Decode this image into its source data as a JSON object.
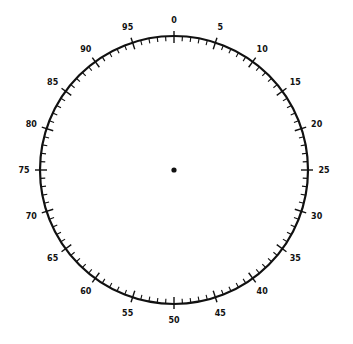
{
  "dial": {
    "center": [
      174,
      170
    ],
    "radius": 134,
    "divisions": 100,
    "major_every": 5,
    "label_radius": 150,
    "labels": [
      "0",
      "5",
      "10",
      "15",
      "20",
      "25",
      "30",
      "35",
      "40",
      "45",
      "50",
      "55",
      "60",
      "65",
      "70",
      "75",
      "80",
      "85",
      "90",
      "95"
    ],
    "stroke_color": "#111111",
    "center_dot": true
  }
}
